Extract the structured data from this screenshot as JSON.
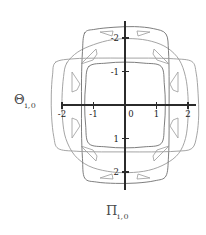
{
  "figure": {
    "type": "phase-portrait",
    "background": "#ffffff",
    "axis_color": "#2b2b2b",
    "curve_color": "#9a9a9a",
    "curve_color_dark": "#6f6f6f",
    "tick_label_color": "#1a1a1a"
  },
  "axes": {
    "y_label_symbol": "Θ",
    "y_label_subscript": "i,0",
    "x_label_symbol": "Π",
    "x_label_subscript": "i,0",
    "x_ticks": [
      "-2",
      "-1",
      "0",
      "1",
      "2"
    ],
    "y_ticks": [
      "2",
      "1",
      "-1",
      "-2"
    ],
    "origin_label": "0",
    "xlim": [
      -2.35,
      2.35
    ],
    "ylim": [
      -2.45,
      2.45
    ]
  },
  "chart_data": {
    "type": "line",
    "title": "",
    "xlabel": "Π i,0",
    "ylabel": "Θ i,0",
    "xlim": [
      -2.35,
      2.35
    ],
    "ylim": [
      -2.45,
      2.45
    ],
    "xticks": [
      -2,
      -1,
      0,
      1,
      2
    ],
    "yticks": [
      -2,
      -1,
      1,
      2
    ],
    "grid": false,
    "legend": "none",
    "series": [
      {
        "name": "contour-outer",
        "closed": true,
        "points": [
          [
            -1.85,
            1.25
          ],
          [
            -1.95,
            0.85
          ],
          [
            -2.0,
            0.2
          ],
          [
            -1.98,
            -0.45
          ],
          [
            -1.88,
            -1.0
          ],
          [
            -1.6,
            -1.5
          ],
          [
            -1.15,
            -1.82
          ],
          [
            -0.55,
            -1.98
          ],
          [
            0.1,
            -2.02
          ],
          [
            0.75,
            -1.95
          ],
          [
            1.3,
            -1.75
          ],
          [
            1.7,
            -1.45
          ],
          [
            1.92,
            -1.0
          ],
          [
            2.0,
            -0.4
          ],
          [
            2.0,
            0.25
          ],
          [
            1.92,
            0.85
          ],
          [
            1.72,
            1.35
          ],
          [
            1.35,
            1.7
          ],
          [
            0.85,
            1.9
          ],
          [
            0.25,
            1.98
          ],
          [
            -0.4,
            1.95
          ],
          [
            -1.0,
            1.8
          ],
          [
            -1.5,
            1.58
          ]
        ]
      },
      {
        "name": "contour-tall",
        "closed": true,
        "points": [
          [
            -1.28,
            2.15
          ],
          [
            -1.35,
            1.6
          ],
          [
            -1.38,
            0.8
          ],
          [
            -1.38,
            0.0
          ],
          [
            -1.38,
            -0.8
          ],
          [
            -1.35,
            -1.6
          ],
          [
            -1.28,
            -2.18
          ],
          [
            -0.9,
            -2.3
          ],
          [
            -0.3,
            -2.34
          ],
          [
            0.35,
            -2.33
          ],
          [
            0.95,
            -2.26
          ],
          [
            1.3,
            -2.12
          ],
          [
            1.38,
            -1.55
          ],
          [
            1.4,
            -0.75
          ],
          [
            1.4,
            0.05
          ],
          [
            1.4,
            0.85
          ],
          [
            1.38,
            1.62
          ],
          [
            1.3,
            2.12
          ],
          [
            0.9,
            2.28
          ],
          [
            0.3,
            2.34
          ],
          [
            -0.35,
            2.32
          ],
          [
            -0.95,
            2.26
          ]
        ]
      },
      {
        "name": "contour-wide",
        "closed": true,
        "points": [
          [
            -2.2,
            1.28
          ],
          [
            -2.3,
            0.9
          ],
          [
            -2.34,
            0.3
          ],
          [
            -2.33,
            -0.35
          ],
          [
            -2.26,
            -0.95
          ],
          [
            -2.12,
            -1.3
          ],
          [
            -1.55,
            -1.38
          ],
          [
            -0.75,
            -1.4
          ],
          [
            0.05,
            -1.4
          ],
          [
            0.85,
            -1.4
          ],
          [
            1.62,
            -1.38
          ],
          [
            2.12,
            -1.3
          ],
          [
            2.28,
            -0.9
          ],
          [
            2.34,
            -0.3
          ],
          [
            2.32,
            0.35
          ],
          [
            2.26,
            0.95
          ],
          [
            2.12,
            1.3
          ],
          [
            1.55,
            1.38
          ],
          [
            0.75,
            1.4
          ],
          [
            -0.05,
            1.4
          ],
          [
            -0.85,
            1.4
          ],
          [
            -1.62,
            1.38
          ]
        ]
      },
      {
        "name": "contour-inner",
        "closed": true,
        "points": [
          [
            -1.15,
            1.15
          ],
          [
            -1.25,
            0.6
          ],
          [
            -1.28,
            0.0
          ],
          [
            -1.25,
            -0.6
          ],
          [
            -1.15,
            -1.15
          ],
          [
            -0.6,
            -1.25
          ],
          [
            0.0,
            -1.28
          ],
          [
            0.6,
            -1.25
          ],
          [
            1.15,
            -1.15
          ],
          [
            1.25,
            -0.6
          ],
          [
            1.28,
            0.0
          ],
          [
            1.25,
            0.6
          ],
          [
            1.15,
            1.15
          ],
          [
            0.6,
            1.25
          ],
          [
            0.0,
            1.28
          ],
          [
            -0.6,
            1.25
          ]
        ]
      }
    ]
  }
}
